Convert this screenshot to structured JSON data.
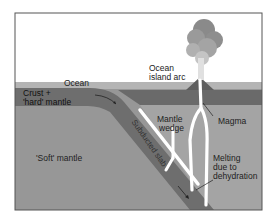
{
  "diagram": {
    "colors": {
      "background": "#ffffff",
      "frame": "#555555",
      "sky": "#ffffff",
      "ocean": "#b4b4b4",
      "crust_hard_mantle": "#6e6e6e",
      "soft_mantle": "#979797",
      "mantle_wedge": "#a4a4a4",
      "magma": "#ffffff",
      "plume_dark": "#8a8a8a",
      "plume_light": "#d0d0d0"
    },
    "labels": {
      "ocean": "Ocean",
      "crust_line1": "Crust +",
      "crust_line2": "'hard' mantle",
      "soft_mantle": "'Soft' mantle",
      "subducted_slab": "Subducted slab",
      "island_arc_line1": "Ocean",
      "island_arc_line2": "island arc",
      "mantle_wedge_line1": "Mantle",
      "mantle_wedge_line2": "wedge",
      "magma": "Magma",
      "melting_line1": "Melting",
      "melting_line2": "due to",
      "melting_line3": "dehydration"
    }
  }
}
